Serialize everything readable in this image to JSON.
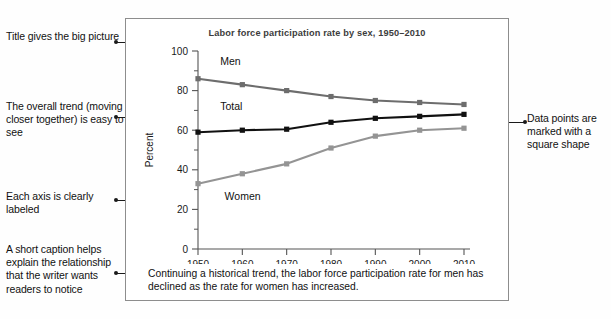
{
  "annotations": {
    "left": [
      {
        "id": "title-note",
        "text": "Title gives the big picture",
        "top": 30,
        "arrow_top": 38
      },
      {
        "id": "trend-note",
        "text": "The overall trend (moving closer together) is easy to see",
        "top": 100,
        "arrow_top": 113
      },
      {
        "id": "axis-note",
        "text": "Each axis is clearly labeled",
        "top": 190,
        "arrow_top": 196
      },
      {
        "id": "caption-note",
        "text": "A short caption helps explain the relationship that the writer wants readers to notice",
        "top": 243,
        "arrow_top": 269
      }
    ],
    "right": [
      {
        "id": "marker-note",
        "text": "Data points are marked with a square shape",
        "top": 112,
        "arrow_top": 118
      }
    ]
  },
  "figure": {
    "title": "Labor force participation rate by sex, 1950–2010",
    "caption": "Continuing a historical trend, the labor force participation rate for men has declined as the rate for women has increased."
  },
  "chart_data": {
    "type": "line",
    "title": "Labor force participation rate by sex, 1950–2010",
    "xlabel": "",
    "ylabel": "Percent",
    "x": [
      1950,
      1960,
      1970,
      1980,
      1990,
      2000,
      2010
    ],
    "xtick_labels": [
      "1950",
      "1960",
      "1970",
      "1980",
      "1990",
      "2000",
      "2010"
    ],
    "ytick_labels": [
      "0",
      "20",
      "40",
      "60",
      "80",
      "100"
    ],
    "yticks": [
      0,
      20,
      40,
      60,
      80,
      100
    ],
    "yminor_step": 10,
    "xlim": [
      1950,
      2010
    ],
    "ylim": [
      0,
      100
    ],
    "grid": false,
    "legend": "inline-labels",
    "marker": "square",
    "series": [
      {
        "name": "Men",
        "label": "Men",
        "color": "#6d6d6d",
        "values": [
          86,
          83,
          80,
          77,
          75,
          74,
          73
        ]
      },
      {
        "name": "Total",
        "label": "Total",
        "color": "#111111",
        "values": [
          59,
          60,
          60.5,
          64,
          66,
          67,
          68
        ]
      },
      {
        "name": "Women",
        "label": "Women",
        "color": "#949494",
        "values": [
          33,
          38,
          43,
          51,
          57,
          60,
          61
        ]
      }
    ]
  },
  "bottom_strip": {
    "text": ""
  }
}
